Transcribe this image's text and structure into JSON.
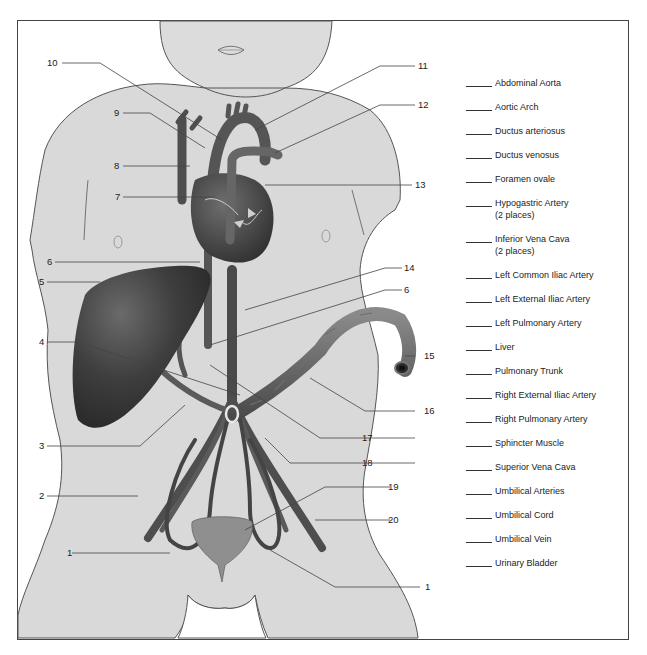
{
  "diagram": {
    "callout_numbers": [
      {
        "id": "n10",
        "text": "10"
      },
      {
        "id": "n9",
        "text": "9"
      },
      {
        "id": "n8",
        "text": "8"
      },
      {
        "id": "n7",
        "text": "7"
      },
      {
        "id": "n6a",
        "text": "6"
      },
      {
        "id": "n5",
        "text": "5"
      },
      {
        "id": "n4",
        "text": "4"
      },
      {
        "id": "n3",
        "text": "3"
      },
      {
        "id": "n2",
        "text": "2"
      },
      {
        "id": "n1a",
        "text": "1"
      },
      {
        "id": "n11",
        "text": "11"
      },
      {
        "id": "n12",
        "text": "12"
      },
      {
        "id": "n13",
        "text": "13"
      },
      {
        "id": "n14",
        "text": "14"
      },
      {
        "id": "n6b",
        "text": "6"
      },
      {
        "id": "n15",
        "text": "15"
      },
      {
        "id": "n16",
        "text": "16"
      },
      {
        "id": "n17",
        "text": "17"
      },
      {
        "id": "n18",
        "text": "18"
      },
      {
        "id": "n19",
        "text": "19"
      },
      {
        "id": "n20",
        "text": "20"
      },
      {
        "id": "n1b",
        "text": "1"
      }
    ]
  },
  "legend": {
    "items": [
      {
        "label": "Abdominal Aorta"
      },
      {
        "label": "Aortic Arch"
      },
      {
        "label": "Ductus arteriosus"
      },
      {
        "label": "Ductus venosus"
      },
      {
        "label": "Foramen ovale"
      },
      {
        "label": "Hypogastric Artery",
        "note": "(2 places)"
      },
      {
        "label": "Inferior Vena Cava",
        "note": "(2 places)"
      },
      {
        "label": "Left Common Iliac Artery"
      },
      {
        "label": "Left External Iliac Artery"
      },
      {
        "label": "Left Pulmonary Artery"
      },
      {
        "label": "Liver"
      },
      {
        "label": "Pulmonary Trunk"
      },
      {
        "label": "Right External Iliac Artery"
      },
      {
        "label": "Right Pulmonary Artery"
      },
      {
        "label": "Sphincter Muscle"
      },
      {
        "label": "Superior Vena Cava"
      },
      {
        "label": "Umbilical Arteries"
      },
      {
        "label": "Umbilical Cord"
      },
      {
        "label": "Umbilical Vein"
      },
      {
        "label": "Urinary Bladder"
      }
    ]
  },
  "colors": {
    "skin": "#d9d9d9",
    "outline": "#555555",
    "vessel": "#5a5a5a",
    "organ_dark": "#3a3a3a",
    "frame": "#444444"
  }
}
